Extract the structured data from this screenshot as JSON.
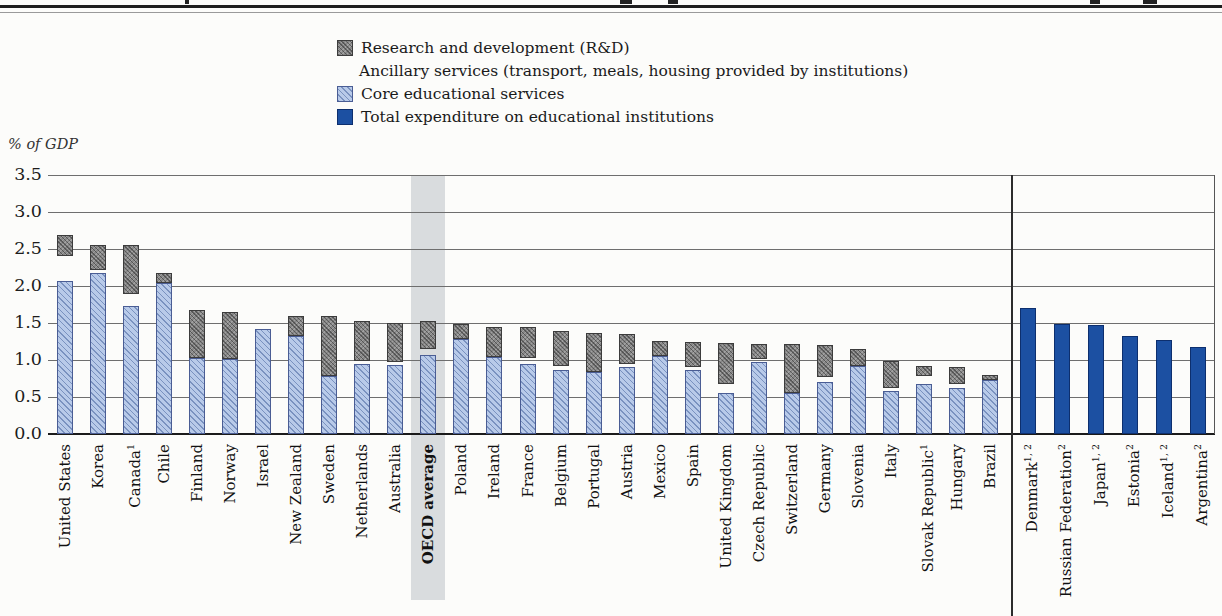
{
  "chart_data": {
    "type": "bar",
    "stacked": true,
    "ylabel": "% of GDP",
    "unit": "% of GDP",
    "ylim": [
      0,
      3.5
    ],
    "yticks": [
      "3.5",
      "3.0",
      "2.5",
      "2.0",
      "1.5",
      "1.0",
      "0.5",
      "0.0"
    ],
    "grid": true,
    "legend_position": "top",
    "legend": [
      {
        "key": "rnd",
        "label": "Research and development (R&D)",
        "swatch": "gray-crosshatch",
        "color": "#878787"
      },
      {
        "key": "ancillary",
        "label": "Ancillary services (transport, meals, housing provided by institutions)",
        "swatch": "black",
        "color": "#0b0b0b"
      },
      {
        "key": "core",
        "label": "Core educational services",
        "swatch": "lightblue-hatch",
        "color": "#b8cae9"
      },
      {
        "key": "total",
        "label": "Total expenditure on educational institutions",
        "swatch": "solid-blue",
        "color": "#1c50a2"
      }
    ],
    "highlight_label": "OECD average",
    "left_panel": {
      "series_keys": [
        "core",
        "ancillary",
        "rnd"
      ],
      "bars": [
        {
          "label": "United States",
          "core": 2.07,
          "ancillary": 0.34,
          "rnd": 0.28,
          "total": 2.69
        },
        {
          "label": "Korea",
          "core": 2.18,
          "ancillary": 0.04,
          "rnd": 0.33,
          "total": 2.55
        },
        {
          "label": "Canada",
          "sup": "1",
          "core": 1.73,
          "ancillary": 0.16,
          "rnd": 0.66,
          "total": 2.55
        },
        {
          "label": "Chile",
          "core": 2.04,
          "ancillary": 0,
          "rnd": 0.13,
          "total": 2.17
        },
        {
          "label": "Finland",
          "core": 1.03,
          "ancillary": 0,
          "rnd": 0.65,
          "total": 1.68
        },
        {
          "label": "Norway",
          "core": 1.01,
          "ancillary": 0,
          "rnd": 0.64,
          "total": 1.65
        },
        {
          "label": "Israel",
          "core": 1.42,
          "ancillary": 0.23,
          "rnd": 0,
          "total": 1.65
        },
        {
          "label": "New Zealand",
          "core": 1.33,
          "ancillary": 0,
          "rnd": 0.27,
          "total": 1.6
        },
        {
          "label": "Sweden",
          "core": 0.78,
          "ancillary": 0,
          "rnd": 0.82,
          "total": 1.6
        },
        {
          "label": "Netherlands",
          "core": 0.95,
          "ancillary": 0.03,
          "rnd": 0.55,
          "total": 1.53
        },
        {
          "label": "Australia",
          "core": 0.93,
          "ancillary": 0.05,
          "rnd": 0.52,
          "total": 1.5
        },
        {
          "label": "OECD average",
          "core": 1.07,
          "ancillary": 0.08,
          "rnd": 0.38,
          "total": 1.53,
          "highlight": true
        },
        {
          "label": "Poland",
          "core": 1.28,
          "ancillary": 0,
          "rnd": 0.21,
          "total": 1.49
        },
        {
          "label": "Ireland",
          "core": 1.04,
          "ancillary": 0,
          "rnd": 0.41,
          "total": 1.45
        },
        {
          "label": "France",
          "core": 0.95,
          "ancillary": 0.08,
          "rnd": 0.42,
          "total": 1.45
        },
        {
          "label": "Belgium",
          "core": 0.86,
          "ancillary": 0.06,
          "rnd": 0.47,
          "total": 1.39
        },
        {
          "label": "Portugal",
          "core": 0.84,
          "ancillary": 0,
          "rnd": 0.53,
          "total": 1.37
        },
        {
          "label": "Austria",
          "core": 0.9,
          "ancillary": 0.04,
          "rnd": 0.41,
          "total": 1.35
        },
        {
          "label": "Mexico",
          "core": 1.05,
          "ancillary": 0,
          "rnd": 0.21,
          "total": 1.26
        },
        {
          "label": "Spain",
          "core": 0.86,
          "ancillary": 0.05,
          "rnd": 0.33,
          "total": 1.24
        },
        {
          "label": "United Kingdom",
          "core": 0.56,
          "ancillary": 0.11,
          "rnd": 0.56,
          "total": 1.23
        },
        {
          "label": "Czech Republic",
          "core": 0.97,
          "ancillary": 0.04,
          "rnd": 0.21,
          "total": 1.22
        },
        {
          "label": "Switzerland",
          "core": 0.55,
          "ancillary": 0,
          "rnd": 0.66,
          "total": 1.21
        },
        {
          "label": "Germany",
          "core": 0.7,
          "ancillary": 0.07,
          "rnd": 0.43,
          "total": 1.2
        },
        {
          "label": "Slovenia",
          "core": 0.92,
          "ancillary": 0,
          "rnd": 0.23,
          "total": 1.15
        },
        {
          "label": "Italy",
          "core": 0.58,
          "ancillary": 0.04,
          "rnd": 0.37,
          "total": 0.99
        },
        {
          "label": "Slovak Republic",
          "sup": "1",
          "core": 0.67,
          "ancillary": 0.11,
          "rnd": 0.14,
          "total": 0.92
        },
        {
          "label": "Hungary",
          "core": 0.62,
          "ancillary": 0.06,
          "rnd": 0.22,
          "total": 0.9
        },
        {
          "label": "Brazil",
          "core": 0.73,
          "ancillary": 0,
          "rnd": 0.07,
          "total": 0.8
        }
      ]
    },
    "right_panel": {
      "series_keys": [
        "total"
      ],
      "bars": [
        {
          "label": "Denmark",
          "sup": "1, 2",
          "total": 1.7
        },
        {
          "label": "Russian Federation",
          "sup": "2",
          "total": 1.49
        },
        {
          "label": "Japan",
          "sup": "1, 2",
          "total": 1.47
        },
        {
          "label": "Estonia",
          "sup": "2",
          "total": 1.33
        },
        {
          "label": "Iceland",
          "sup": "1, 2",
          "total": 1.27
        },
        {
          "label": "Argentina",
          "sup": "2",
          "total": 1.17
        }
      ]
    }
  }
}
